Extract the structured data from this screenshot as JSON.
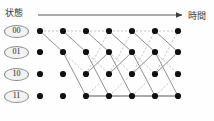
{
  "figure": {
    "type": "trellis-diagram",
    "axis": {
      "vertical_label": "状態",
      "horizontal_label": "時間",
      "arrow_icon": "right-arrow-icon"
    },
    "states": [
      {
        "id": "s00",
        "label": "00",
        "row": 0
      },
      {
        "id": "s01",
        "label": "01",
        "row": 1
      },
      {
        "id": "s10",
        "label": "10",
        "row": 2
      },
      {
        "id": "s11",
        "label": "11",
        "row": 3
      }
    ],
    "columns": 7,
    "column_x": [
      40,
      63,
      86,
      109,
      132,
      155,
      178
    ],
    "row_y": [
      31,
      52,
      74,
      96
    ],
    "node_radius": 3.1,
    "colors": {
      "node": "#111111",
      "solid_edge": "#8a8a8a",
      "dashed_edge": "#b9b9b9",
      "axis": "#555555",
      "badge_fill": "#f2f2f2",
      "badge_stroke": "#8c8c8c",
      "background": "#fefefe"
    },
    "edges": [
      {
        "from_col": 0,
        "from_state": 0,
        "to_state": 0,
        "style": "dashed"
      },
      {
        "from_col": 0,
        "from_state": 0,
        "to_state": 1,
        "style": "solid"
      },
      {
        "from_col": 1,
        "from_state": 0,
        "to_state": 0,
        "style": "dashed"
      },
      {
        "from_col": 1,
        "from_state": 0,
        "to_state": 1,
        "style": "solid"
      },
      {
        "from_col": 1,
        "from_state": 1,
        "to_state": 2,
        "style": "dashed"
      },
      {
        "from_col": 1,
        "from_state": 1,
        "to_state": 3,
        "style": "solid"
      },
      {
        "from_col": 2,
        "from_state": 0,
        "to_state": 0,
        "style": "dashed"
      },
      {
        "from_col": 2,
        "from_state": 0,
        "to_state": 1,
        "style": "solid"
      },
      {
        "from_col": 2,
        "from_state": 1,
        "to_state": 2,
        "style": "dashed"
      },
      {
        "from_col": 2,
        "from_state": 1,
        "to_state": 3,
        "style": "solid"
      },
      {
        "from_col": 2,
        "from_state": 2,
        "to_state": 0,
        "style": "dashed"
      },
      {
        "from_col": 2,
        "from_state": 2,
        "to_state": 1,
        "style": "solid"
      },
      {
        "from_col": 2,
        "from_state": 3,
        "to_state": 2,
        "style": "dashed"
      },
      {
        "from_col": 2,
        "from_state": 3,
        "to_state": 3,
        "style": "solid"
      },
      {
        "from_col": 3,
        "from_state": 0,
        "to_state": 0,
        "style": "dashed"
      },
      {
        "from_col": 3,
        "from_state": 0,
        "to_state": 1,
        "style": "solid"
      },
      {
        "from_col": 3,
        "from_state": 1,
        "to_state": 2,
        "style": "dashed"
      },
      {
        "from_col": 3,
        "from_state": 1,
        "to_state": 3,
        "style": "solid"
      },
      {
        "from_col": 3,
        "from_state": 2,
        "to_state": 0,
        "style": "dashed"
      },
      {
        "from_col": 3,
        "from_state": 2,
        "to_state": 1,
        "style": "solid"
      },
      {
        "from_col": 3,
        "from_state": 3,
        "to_state": 2,
        "style": "dashed"
      },
      {
        "from_col": 3,
        "from_state": 3,
        "to_state": 3,
        "style": "solid"
      },
      {
        "from_col": 4,
        "from_state": 0,
        "to_state": 0,
        "style": "dashed"
      },
      {
        "from_col": 4,
        "from_state": 0,
        "to_state": 1,
        "style": "solid"
      },
      {
        "from_col": 4,
        "from_state": 1,
        "to_state": 2,
        "style": "dashed"
      },
      {
        "from_col": 4,
        "from_state": 1,
        "to_state": 3,
        "style": "solid"
      },
      {
        "from_col": 4,
        "from_state": 2,
        "to_state": 0,
        "style": "dashed"
      },
      {
        "from_col": 4,
        "from_state": 2,
        "to_state": 1,
        "style": "solid"
      },
      {
        "from_col": 4,
        "from_state": 3,
        "to_state": 2,
        "style": "dashed"
      },
      {
        "from_col": 4,
        "from_state": 3,
        "to_state": 3,
        "style": "solid"
      },
      {
        "from_col": 5,
        "from_state": 0,
        "to_state": 0,
        "style": "dashed"
      },
      {
        "from_col": 5,
        "from_state": 0,
        "to_state": 1,
        "style": "solid"
      },
      {
        "from_col": 5,
        "from_state": 1,
        "to_state": 2,
        "style": "dashed"
      },
      {
        "from_col": 5,
        "from_state": 1,
        "to_state": 3,
        "style": "solid"
      },
      {
        "from_col": 5,
        "from_state": 2,
        "to_state": 0,
        "style": "dashed"
      },
      {
        "from_col": 5,
        "from_state": 2,
        "to_state": 1,
        "style": "solid"
      },
      {
        "from_col": 5,
        "from_state": 3,
        "to_state": 2,
        "style": "dashed"
      },
      {
        "from_col": 5,
        "from_state": 3,
        "to_state": 3,
        "style": "solid"
      }
    ],
    "bottom_rail": {
      "from_col": 2,
      "to_col": 6,
      "state": 3,
      "style": "solid"
    }
  }
}
